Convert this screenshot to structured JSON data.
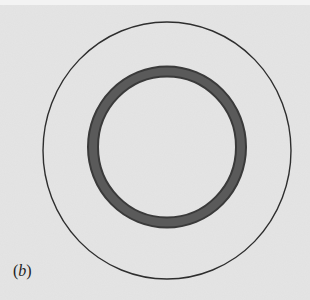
{
  "figure": {
    "panel_label": "(b)",
    "panel_label_parts": {
      "open": "(",
      "letter": "b",
      "close": ")"
    },
    "background_color": "#e5e5e5",
    "outer_circle": {
      "cx": 167,
      "cy": 150.5,
      "rx": 124,
      "ry": 128.5,
      "stroke": "#2e2e2e",
      "stroke_width": 1.4
    },
    "inner_ring": {
      "cx": 167,
      "cy": 147,
      "rx": 74,
      "ry": 75.5,
      "stroke": "#545454",
      "stroke_width": 11
    }
  }
}
